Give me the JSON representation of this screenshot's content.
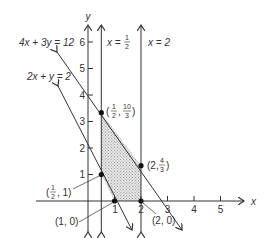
{
  "diagram": {
    "type": "linear-programming-feasible-region",
    "axes": {
      "x_label": "x",
      "y_label": "y",
      "x_ticks": [
        "1",
        "2",
        "3",
        "4",
        "5"
      ],
      "y_ticks": [
        "1",
        "2",
        "3",
        "4",
        "5",
        "6"
      ]
    },
    "lines": [
      {
        "id": "line1",
        "label": "4x + 3y = 12"
      },
      {
        "id": "line2",
        "label": "2x + y = 2"
      },
      {
        "id": "line3",
        "label_lhs": "x =",
        "label_num": "1",
        "label_den": "2"
      },
      {
        "id": "line4",
        "label": "x = 2"
      }
    ],
    "points": [
      {
        "label_prefix": "(",
        "num": "1",
        "den": "2",
        "sep": ",",
        "num2": "10",
        "den2": "3",
        "suffix": ")"
      },
      {
        "label_prefix": "(2,",
        "num": "4",
        "den": "3",
        "suffix": ")"
      },
      {
        "label_prefix": "(",
        "num": "1",
        "den": "2",
        "suffix": ", 1)"
      },
      {
        "label": "(1, 0)"
      },
      {
        "label": "(2, 0)"
      }
    ],
    "colors": {
      "ink": "#333333",
      "shade": "#c8c8c8"
    }
  }
}
